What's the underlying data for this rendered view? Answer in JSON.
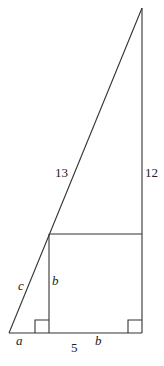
{
  "diagram": {
    "type": "geometry",
    "stroke_color": "#333333",
    "labels": {
      "hypotenuse": "13",
      "vertical_leg": "12",
      "upper_small_hyp": "c",
      "square_side_vertical": "b",
      "bottom_left_segment": "a",
      "base_total": "5",
      "square_side_bottom": "b"
    },
    "points": {
      "apex": [
        142,
        8
      ],
      "bottom_left": [
        9,
        333
      ],
      "bottom_right": [
        142,
        333
      ],
      "square_top_left": [
        49,
        234
      ],
      "square_top_right": [
        142,
        234
      ],
      "square_bottom_left": [
        49,
        333
      ]
    }
  }
}
